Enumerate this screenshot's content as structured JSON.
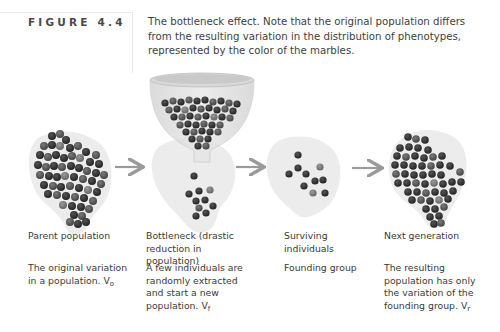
{
  "figure": {
    "label": "FIGURE 4.4",
    "caption": "The bottleneck effect. Note that the original population differs from the resulting variation in the distribution of phenotypes, represented by the color of the marbles."
  },
  "colors": {
    "blob": "#ececec",
    "marble_dark": "#2e2e2e",
    "marble_mid": "#555555",
    "marble_light": "#7a7a7a",
    "arrow": "#9a9a9a",
    "funnel": "#d4d4d4"
  },
  "steps": [
    {
      "title": "Parent population",
      "description": "The original variation in a population.",
      "variable": "V",
      "subscript": "o"
    },
    {
      "title": "Bottleneck (drastic reduction in population)",
      "description": "A few individuals are randomly extracted and start a new population.",
      "variable": "V",
      "subscript": "f"
    },
    {
      "title": "Surviving individuals",
      "description": "Founding group",
      "variable": "",
      "subscript": ""
    },
    {
      "title": "Next generation",
      "description": "The resulting population has only the variation of the founding group.",
      "variable": "V",
      "subscript": "r"
    }
  ],
  "arrows": [
    {
      "from": "parent-population",
      "to": "bottleneck"
    },
    {
      "from": "bottleneck",
      "to": "surviving-individuals"
    },
    {
      "from": "surviving-individuals",
      "to": "next-generation"
    }
  ]
}
